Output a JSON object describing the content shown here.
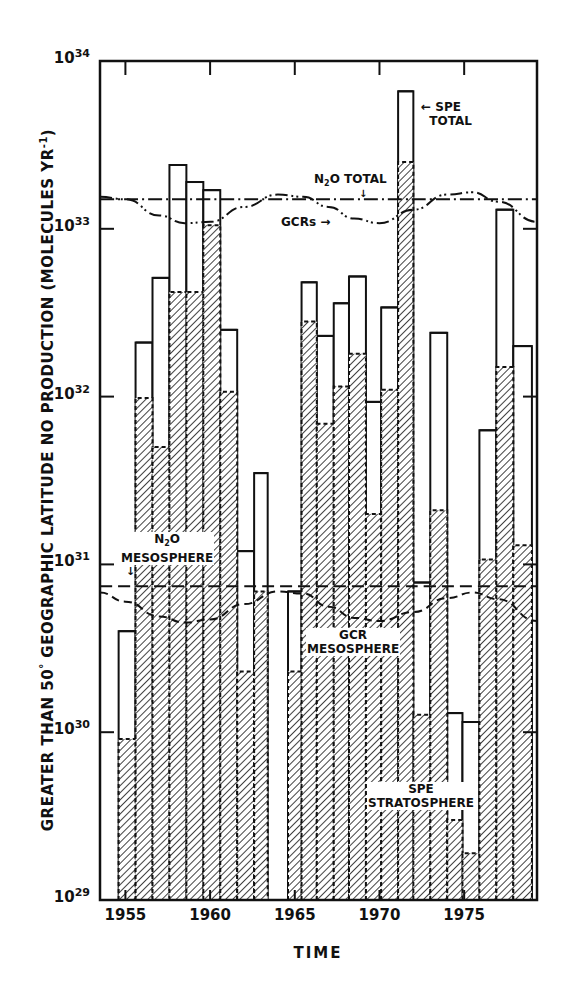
{
  "chart_data": {
    "type": "bar",
    "subtype": "step-histogram-log-scale",
    "title": "",
    "xlabel": "TIME",
    "ylabel": "GREATER THAN 50° GEOGRAPHIC LATITUDE NO PRODUCTION (MOLECULES YR⁻¹)",
    "yscale": "log",
    "ylim": [
      1e+29,
      1e+34
    ],
    "xlim": [
      1953.5,
      1979.3
    ],
    "grid": false,
    "x_ticks": [
      1955,
      1960,
      1965,
      1970,
      1975
    ],
    "x_tick_labels": [
      "1955",
      "1960",
      "1965",
      "1970",
      "1975"
    ],
    "y_tick_labels": [
      {
        "base": "10",
        "exp": "34",
        "value": 1e+34
      },
      {
        "base": "10",
        "exp": "33",
        "value": 1e+33
      },
      {
        "base": "10",
        "exp": "32",
        "value": 1e+32
      },
      {
        "base": "10",
        "exp": "31",
        "value": 1e+31
      },
      {
        "base": "10",
        "exp": "30",
        "value": 1e+30
      },
      {
        "base": "10",
        "exp": "29",
        "value": 1e+29
      }
    ],
    "series": [
      {
        "name": "SPE TOTAL",
        "style": "solid outline",
        "bins": [
          {
            "x0": 1954.6,
            "x1": 1955.6,
            "value": 4e+30
          },
          {
            "x0": 1955.6,
            "x1": 1956.6,
            "value": 2.1e+32
          },
          {
            "x0": 1956.6,
            "x1": 1957.6,
            "value": 5.1e+32
          },
          {
            "x0": 1957.6,
            "x1": 1958.6,
            "value": 2.4e+33
          },
          {
            "x0": 1958.6,
            "x1": 1959.6,
            "value": 1.9e+33
          },
          {
            "x0": 1959.6,
            "x1": 1960.6,
            "value": 1.7e+33
          },
          {
            "x0": 1960.6,
            "x1": 1961.6,
            "value": 2.5e+32
          },
          {
            "x0": 1961.6,
            "x1": 1962.6,
            "value": 1.2e+31
          },
          {
            "x0": 1962.6,
            "x1": 1963.4,
            "value": 3.5e+31
          },
          {
            "x0": 1964.6,
            "x1": 1965.4,
            "value": 6.9e+30
          },
          {
            "x0": 1965.4,
            "x1": 1966.3,
            "value": 4.8e+32
          },
          {
            "x0": 1966.3,
            "x1": 1967.3,
            "value": 2.3e+32
          },
          {
            "x0": 1967.3,
            "x1": 1968.2,
            "value": 3.6e+32
          },
          {
            "x0": 1968.2,
            "x1": 1969.2,
            "value": 5.2e+32
          },
          {
            "x0": 1969.2,
            "x1": 1970.1,
            "value": 9.3e+31
          },
          {
            "x0": 1970.1,
            "x1": 1971.1,
            "value": 3.4e+32
          },
          {
            "x0": 1971.1,
            "x1": 1972.0,
            "value": 6.6e+33
          },
          {
            "x0": 1972.0,
            "x1": 1973.0,
            "value": 7.8e+30
          },
          {
            "x0": 1973.0,
            "x1": 1974.0,
            "value": 2.4e+32
          },
          {
            "x0": 1974.0,
            "x1": 1974.9,
            "value": 1.3e+30
          },
          {
            "x0": 1974.9,
            "x1": 1975.9,
            "value": 1.15e+30
          },
          {
            "x0": 1975.9,
            "x1": 1976.9,
            "value": 6.3e+31
          },
          {
            "x0": 1976.9,
            "x1": 1977.9,
            "value": 1.3e+33
          },
          {
            "x0": 1977.9,
            "x1": 1979.0,
            "value": 2e+32
          }
        ]
      },
      {
        "name": "SPE STRATOSPHERE",
        "style": "hatched fill, dashed outline",
        "bins": [
          {
            "x0": 1954.6,
            "x1": 1955.6,
            "value": 9.1e+29
          },
          {
            "x0": 1955.6,
            "x1": 1956.6,
            "value": 9.8e+31
          },
          {
            "x0": 1956.6,
            "x1": 1957.6,
            "value": 5e+31
          },
          {
            "x0": 1957.6,
            "x1": 1958.6,
            "value": 4.2e+32
          },
          {
            "x0": 1958.6,
            "x1": 1959.6,
            "value": 4.2e+32
          },
          {
            "x0": 1959.6,
            "x1": 1960.6,
            "value": 1.05e+33
          },
          {
            "x0": 1960.6,
            "x1": 1961.6,
            "value": 1.07e+32
          },
          {
            "x0": 1961.6,
            "x1": 1962.6,
            "value": 2.3e+30
          },
          {
            "x0": 1962.6,
            "x1": 1963.4,
            "value": 6.9e+30
          },
          {
            "x0": 1964.6,
            "x1": 1965.4,
            "value": 2.3e+30
          },
          {
            "x0": 1965.4,
            "x1": 1966.3,
            "value": 2.8e+32
          },
          {
            "x0": 1966.3,
            "x1": 1967.3,
            "value": 6.9e+31
          },
          {
            "x0": 1967.3,
            "x1": 1968.2,
            "value": 1.15e+32
          },
          {
            "x0": 1968.2,
            "x1": 1969.2,
            "value": 1.8e+32
          },
          {
            "x0": 1969.2,
            "x1": 1970.1,
            "value": 2e+31
          },
          {
            "x0": 1970.1,
            "x1": 1971.1,
            "value": 1.1e+32
          },
          {
            "x0": 1971.1,
            "x1": 1972.0,
            "value": 2.5e+33
          },
          {
            "x0": 1972.0,
            "x1": 1973.0,
            "value": 1.27e+30
          },
          {
            "x0": 1973.0,
            "x1": 1974.0,
            "value": 2.1e+31
          },
          {
            "x0": 1974.0,
            "x1": 1974.9,
            "value": 3e+29
          },
          {
            "x0": 1974.9,
            "x1": 1975.9,
            "value": 1.9e+29
          },
          {
            "x0": 1975.9,
            "x1": 1976.9,
            "value": 1.07e+31
          },
          {
            "x0": 1976.9,
            "x1": 1977.9,
            "value": 1.5e+32
          },
          {
            "x0": 1977.9,
            "x1": 1979.0,
            "value": 1.3e+31
          }
        ]
      },
      {
        "name": "N2O TOTAL",
        "style": "dash-dot line",
        "type": "line",
        "x": [
          1953.5,
          1979.3
        ],
        "values": [
          1.5e+33,
          1.5e+33
        ]
      },
      {
        "name": "GCRs",
        "style": "dash-dot-dot line",
        "type": "line",
        "x": [
          1953.5,
          1955,
          1957,
          1958.5,
          1960,
          1962,
          1964,
          1965.5,
          1967,
          1968.5,
          1970,
          1972,
          1974,
          1975.5,
          1977,
          1979.3
        ],
        "values": [
          1.55e+33,
          1.5e+33,
          1.2e+33,
          1.08e+33,
          1.1e+33,
          1.35e+33,
          1.6e+33,
          1.55e+33,
          1.35e+33,
          1.15e+33,
          1.08e+33,
          1.3e+33,
          1.6e+33,
          1.65e+33,
          1.45e+33,
          1.1e+33
        ]
      },
      {
        "name": "N2O MESOSPHERE",
        "style": "dashed line",
        "type": "line",
        "x": [
          1953.5,
          1979.3
        ],
        "values": [
          7.4e+30,
          7.4e+30
        ]
      },
      {
        "name": "GCR MESOSPHERE",
        "style": "dashed curve",
        "type": "line",
        "x": [
          1953.5,
          1955,
          1957,
          1958.5,
          1960,
          1962,
          1964,
          1965.5,
          1967,
          1968.5,
          1970,
          1972,
          1974,
          1975.5,
          1977,
          1979.3
        ],
        "values": [
          6.8e+30,
          6e+30,
          4.9e+30,
          4.5e+30,
          4.7e+30,
          5.8e+30,
          6.9e+30,
          6.7e+30,
          5.6e+30,
          4.8e+30,
          4.6e+30,
          5.2e+30,
          6.3e+30,
          6.8e+30,
          6.2e+30,
          4.6e+30
        ]
      }
    ],
    "annotations": [
      {
        "text": "SPE TOTAL",
        "target_x": 1971.5
      },
      {
        "text": "N₂O TOTAL"
      },
      {
        "text": "GCRs"
      },
      {
        "text": "N₂O MESOSPHERE"
      },
      {
        "text": "GCR MESOSPHERE"
      },
      {
        "text": "SPE STRATOSPHERE"
      }
    ]
  },
  "labels": {
    "xlabel": "TIME",
    "ylabel_main": "GREATER THAN 50",
    "ylabel_degree": "°",
    "ylabel_rest": " GEOGRAPHIC LATITUDE NO PRODUCTION (MOLECULES YR",
    "ylabel_exp": "-1",
    "ylabel_close": ")",
    "spe_total_1": "SPE",
    "spe_total_2": "TOTAL",
    "n2o_total_n": "N",
    "n2o_total_sub": "2",
    "n2o_total_rest": "O TOTAL",
    "gcrs": "GCRs",
    "n2o_meso_n": "N",
    "n2o_meso_sub": "2",
    "n2o_meso_o": "O",
    "n2o_meso_2": "MESOSPHERE",
    "gcr_meso_1": "GCR",
    "gcr_meso_2": "MESOSPHERE",
    "spe_strat_1": "SPE",
    "spe_strat_2": "STRATOSPHERE"
  }
}
